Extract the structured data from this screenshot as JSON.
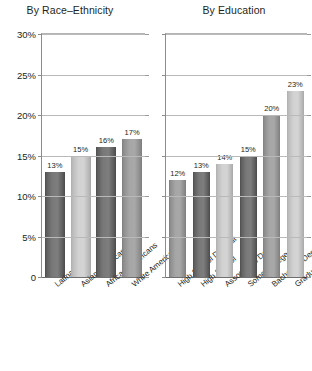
{
  "chart_data": [
    {
      "type": "bar",
      "title": "By Race–Ethnicity",
      "xlabel": "",
      "ylabel": "",
      "ylim": [
        0,
        30
      ],
      "grid": true,
      "legend": "none",
      "ytick_labels": [
        "0",
        "5%",
        "10%",
        "15%",
        "20%",
        "25%",
        "30%"
      ],
      "ytick_values": [
        0,
        5,
        10,
        15,
        20,
        25,
        30
      ],
      "categories": [
        "Latinas",
        "Asian Americans",
        "African Americans",
        "White Americans"
      ],
      "values": [
        13,
        15,
        16,
        17
      ],
      "data_labels": [
        "13%",
        "15%",
        "16%",
        "17%"
      ],
      "bar_shades": [
        "dark",
        "light",
        "dark",
        "mid"
      ]
    },
    {
      "type": "bar",
      "title": "By Education",
      "xlabel": "",
      "ylabel": "",
      "ylim": [
        0,
        30
      ],
      "grid": true,
      "legend": "none",
      "ytick_labels": [
        "0",
        "5%",
        "10%",
        "15%",
        "20%",
        "25%",
        "30%"
      ],
      "ytick_values": [
        0,
        5,
        10,
        15,
        20,
        25,
        30
      ],
      "categories": [
        "High School Dropout",
        "High School",
        "Associate's Degree",
        "Some College",
        "Bachelor's Degree",
        "Graduate Degree"
      ],
      "values": [
        12,
        13,
        14,
        15,
        20,
        23
      ],
      "data_labels": [
        "12%",
        "13%",
        "14%",
        "15%",
        "20%",
        "23%"
      ],
      "bar_shades": [
        "mid",
        "dark",
        "light",
        "dark",
        "mid",
        "light"
      ]
    }
  ]
}
